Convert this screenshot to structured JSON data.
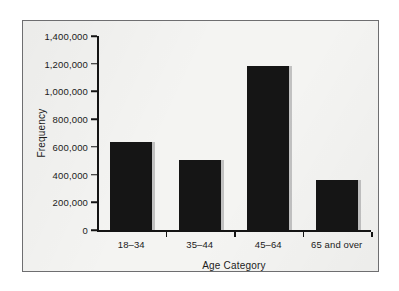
{
  "chart_data": {
    "type": "bar",
    "title": "",
    "xlabel": "Age Category",
    "ylabel": "Frequency",
    "categories": [
      "18–34",
      "35–44",
      "45–64",
      "65 and over"
    ],
    "values": [
      635000,
      505000,
      1183000,
      360000
    ],
    "ylim": [
      0,
      1400000
    ],
    "ytick_values": [
      0,
      200000,
      400000,
      600000,
      800000,
      1000000,
      1200000,
      1400000
    ],
    "ytick_labels": [
      "0",
      "200,000",
      "400,000",
      "600,000",
      "800,000",
      "1,000,000",
      "1,200,000",
      "1,400,000"
    ],
    "grid": false,
    "legend": null,
    "bar_color": "#151515",
    "axis_color": "#141414",
    "background_color": "#f4f4f2",
    "frame_color": "#6e6e70"
  }
}
